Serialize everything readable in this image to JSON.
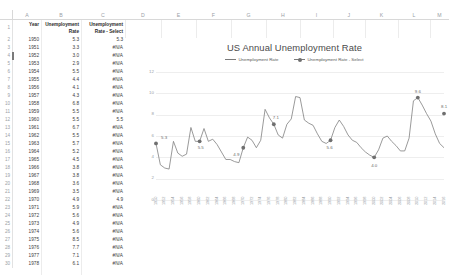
{
  "spreadsheet": {
    "column_headers": [
      "A",
      "B",
      "C",
      "D",
      "E",
      "F",
      "G",
      "H",
      "I",
      "J",
      "K",
      "L",
      "M"
    ],
    "row_numbers": [
      1,
      2,
      3,
      4,
      5,
      6,
      7,
      8,
      9,
      10,
      11,
      12,
      13,
      14,
      15,
      16,
      17,
      18,
      19,
      20,
      21,
      22,
      23,
      24,
      25,
      26,
      27,
      28,
      29,
      30
    ],
    "headers": {
      "a": "Year",
      "b": "Unemployment Rate",
      "c": "Unemployment Rate - Select"
    },
    "active_cell_row": 4,
    "rows": [
      {
        "n": 2,
        "year": "1950",
        "rate": "5.3",
        "select": "5.3"
      },
      {
        "n": 3,
        "year": "1951",
        "rate": "3.3",
        "select": "#N/A"
      },
      {
        "n": 4,
        "year": "1952",
        "rate": "3.0",
        "select": "#N/A"
      },
      {
        "n": 5,
        "year": "1953",
        "rate": "2.9",
        "select": "#N/A"
      },
      {
        "n": 6,
        "year": "1954",
        "rate": "5.5",
        "select": "#N/A"
      },
      {
        "n": 7,
        "year": "1955",
        "rate": "4.4",
        "select": "#N/A"
      },
      {
        "n": 8,
        "year": "1956",
        "rate": "4.1",
        "select": "#N/A"
      },
      {
        "n": 9,
        "year": "1957",
        "rate": "4.3",
        "select": "#N/A"
      },
      {
        "n": 10,
        "year": "1958",
        "rate": "6.8",
        "select": "#N/A"
      },
      {
        "n": 11,
        "year": "1959",
        "rate": "5.5",
        "select": "#N/A"
      },
      {
        "n": 12,
        "year": "1960",
        "rate": "5.5",
        "select": "5.5"
      },
      {
        "n": 13,
        "year": "1961",
        "rate": "6.7",
        "select": "#N/A"
      },
      {
        "n": 14,
        "year": "1962",
        "rate": "5.5",
        "select": "#N/A"
      },
      {
        "n": 15,
        "year": "1963",
        "rate": "5.7",
        "select": "#N/A"
      },
      {
        "n": 16,
        "year": "1964",
        "rate": "5.2",
        "select": "#N/A"
      },
      {
        "n": 17,
        "year": "1965",
        "rate": "4.5",
        "select": "#N/A"
      },
      {
        "n": 18,
        "year": "1966",
        "rate": "3.8",
        "select": "#N/A"
      },
      {
        "n": 19,
        "year": "1967",
        "rate": "3.8",
        "select": "#N/A"
      },
      {
        "n": 20,
        "year": "1968",
        "rate": "3.6",
        "select": "#N/A"
      },
      {
        "n": 21,
        "year": "1969",
        "rate": "3.5",
        "select": "#N/A"
      },
      {
        "n": 22,
        "year": "1970",
        "rate": "4.9",
        "select": "4.9"
      },
      {
        "n": 23,
        "year": "1971",
        "rate": "5.9",
        "select": "#N/A"
      },
      {
        "n": 24,
        "year": "1972",
        "rate": "5.6",
        "select": "#N/A"
      },
      {
        "n": 25,
        "year": "1973",
        "rate": "4.9",
        "select": "#N/A"
      },
      {
        "n": 26,
        "year": "1974",
        "rate": "5.6",
        "select": "#N/A"
      },
      {
        "n": 27,
        "year": "1975",
        "rate": "8.5",
        "select": "#N/A"
      },
      {
        "n": 28,
        "year": "1976",
        "rate": "7.7",
        "select": "#N/A"
      },
      {
        "n": 29,
        "year": "1977",
        "rate": "7.1",
        "select": "#N/A"
      },
      {
        "n": 30,
        "year": "1978",
        "rate": "6.1",
        "select": "#N/A"
      }
    ]
  },
  "chart_data": {
    "type": "line",
    "title": "US Annual Unemployment Rate",
    "xlabel": "",
    "ylabel": "",
    "ylim": [
      0,
      12
    ],
    "yticks": [
      0,
      2,
      4,
      6,
      8,
      10,
      12
    ],
    "grid": true,
    "legend_position": "top",
    "legend": [
      "Unemployment Rate",
      "Unemployment Rate - Select"
    ],
    "x": [
      1950,
      1951,
      1952,
      1953,
      1954,
      1955,
      1956,
      1957,
      1958,
      1959,
      1960,
      1961,
      1962,
      1963,
      1964,
      1965,
      1966,
      1967,
      1968,
      1969,
      1970,
      1971,
      1972,
      1973,
      1974,
      1975,
      1976,
      1977,
      1978,
      1979,
      1980,
      1981,
      1982,
      1983,
      1984,
      1985,
      1986,
      1987,
      1988,
      1989,
      1990,
      1991,
      1992,
      1993,
      1994,
      1995,
      1996,
      1997,
      1998,
      1999,
      2000,
      2001,
      2002,
      2003,
      2004,
      2005,
      2006,
      2007,
      2008,
      2009,
      2010,
      2011,
      2012,
      2013,
      2014,
      2015,
      2016
    ],
    "series": [
      {
        "name": "Unemployment Rate",
        "values": [
          5.3,
          3.3,
          3.0,
          2.9,
          5.5,
          4.4,
          4.1,
          4.3,
          6.8,
          5.5,
          5.5,
          6.7,
          5.5,
          5.7,
          5.2,
          4.5,
          3.8,
          3.8,
          3.6,
          3.5,
          4.9,
          5.9,
          5.6,
          4.9,
          5.6,
          8.5,
          7.7,
          7.1,
          6.1,
          5.8,
          7.1,
          7.6,
          9.7,
          9.6,
          7.5,
          7.2,
          7.0,
          6.2,
          5.5,
          5.3,
          5.6,
          6.8,
          7.5,
          6.9,
          6.1,
          5.6,
          5.4,
          4.9,
          4.5,
          4.2,
          4.0,
          4.7,
          5.8,
          6.0,
          5.5,
          5.1,
          4.6,
          4.6,
          5.8,
          9.3,
          9.6,
          8.9,
          8.1,
          7.4,
          6.2,
          5.3,
          4.9
        ]
      },
      {
        "name": "Unemployment Rate - Select",
        "values": [
          5.3,
          null,
          null,
          null,
          null,
          null,
          null,
          null,
          null,
          null,
          5.5,
          null,
          null,
          null,
          null,
          null,
          null,
          null,
          null,
          null,
          4.9,
          null,
          null,
          null,
          null,
          null,
          null,
          7.1,
          null,
          null,
          null,
          null,
          null,
          null,
          null,
          null,
          null,
          null,
          null,
          null,
          5.6,
          null,
          null,
          null,
          null,
          null,
          null,
          null,
          null,
          null,
          4.0,
          null,
          null,
          null,
          null,
          null,
          null,
          null,
          null,
          null,
          9.6,
          null,
          null,
          null,
          null,
          null,
          8.1
        ]
      }
    ],
    "point_labels": [
      {
        "year": 1950,
        "value": "5.3"
      },
      {
        "year": 1960,
        "value": "5.5"
      },
      {
        "year": 1970,
        "value": "4.9"
      },
      {
        "year": 1977,
        "value": "7.1"
      },
      {
        "year": 1990,
        "value": "5.6"
      },
      {
        "year": 2000,
        "value": "4.0"
      },
      {
        "year": 2010,
        "value": "9.6"
      },
      {
        "year": 2016,
        "value": "8.1"
      }
    ]
  },
  "colors": {
    "line": "#808080",
    "marker": "#6f6f6f",
    "gridline": "#eeeeee",
    "axis_text": "#9aa0a6",
    "title_text": "#4a4a4a"
  }
}
